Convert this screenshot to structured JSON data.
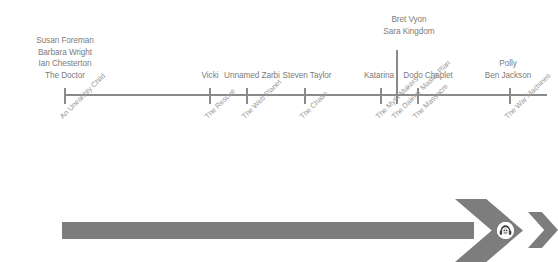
{
  "diagram": {
    "type": "timeline",
    "axis": {
      "color": "#8a8a8a",
      "y": 95,
      "x_start": 65,
      "x_end": 547
    },
    "colors": {
      "axis": "#8a8a8a",
      "character_text": "#7c7c7c",
      "serial_text": "#9a9a9a",
      "arrow": "#7d7d7d",
      "background": "#ffffff",
      "icon_fill": "#ffffff"
    },
    "events": [
      {
        "x": 65,
        "serial": "An Unearthly Child",
        "characters": [
          "Susan Foreman",
          "Barbara Wright",
          "Ian Chesterton",
          "The Doctor"
        ],
        "label_x": 65,
        "riser": false
      },
      {
        "x": 210,
        "serial": "The Rescue",
        "characters": [
          "Vicki"
        ],
        "label_x": 210,
        "riser": false
      },
      {
        "x": 247,
        "serial": "The Web Planet",
        "characters": [
          "Unnamed Zarbi"
        ],
        "label_x": 252,
        "riser": false
      },
      {
        "x": 305,
        "serial": "The Chase",
        "characters": [
          "Steven Taylor"
        ],
        "label_x": 307,
        "riser": false
      },
      {
        "x": 381,
        "serial": "The Myth Makers",
        "characters": [
          "Katarina"
        ],
        "label_x": 379,
        "riser": false
      },
      {
        "x": 397,
        "serial": "The Daleks' Master Plan",
        "characters": [
          "Bret Vyon",
          "Sara Kingdom"
        ],
        "label_x": 409,
        "riser": true
      },
      {
        "x": 418,
        "serial": "The Massacre",
        "characters": [
          "Dodo Chaplet"
        ],
        "label_x": 428,
        "riser": false
      },
      {
        "x": 510,
        "serial": "The War Machines",
        "characters": [
          "Polly",
          "Ben Jackson"
        ],
        "label_x": 508,
        "riser": false
      }
    ],
    "arrow": {
      "bar_x": 62,
      "bar_y": 222,
      "bar_width": 410,
      "bar_height": 17,
      "icon_name": "companion-face-icon"
    }
  }
}
